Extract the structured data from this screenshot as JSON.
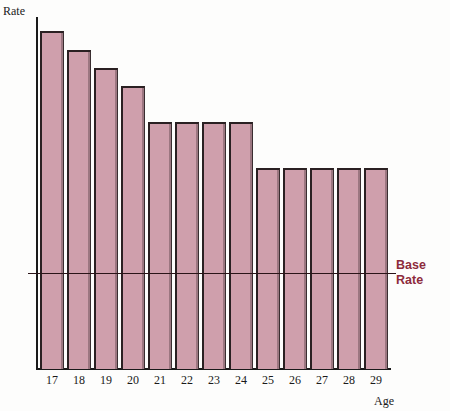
{
  "chart_data": {
    "type": "bar",
    "title": "",
    "xlabel": "Age",
    "ylabel": "Rate",
    "categories": [
      "17",
      "18",
      "19",
      "20",
      "21",
      "22",
      "23",
      "24",
      "25",
      "26",
      "27",
      "28",
      "29"
    ],
    "values": [
      100,
      94.4,
      89.0,
      83.6,
      73.0,
      73.0,
      73.0,
      73.0,
      59.5,
      59.5,
      59.5,
      59.5,
      59.5
    ],
    "ylim": [
      0,
      104
    ],
    "grid": false,
    "legend": false,
    "annotations": [
      {
        "name": "base-rate-line",
        "label_line1": "Base",
        "label_line2": "Rate",
        "value": 28.5,
        "orientation": "horizontal",
        "color": "#8d2b3c"
      }
    ],
    "bar_fill_color": "#cf9fac",
    "bar_edge_color": "#2a2022",
    "axis_color": "#1a1a1a",
    "background_color": "#fdfdfc"
  },
  "axes": {
    "y_title": "Rate",
    "x_title": "Age"
  },
  "base_rate": {
    "line1": "Base",
    "line2": "Rate"
  }
}
